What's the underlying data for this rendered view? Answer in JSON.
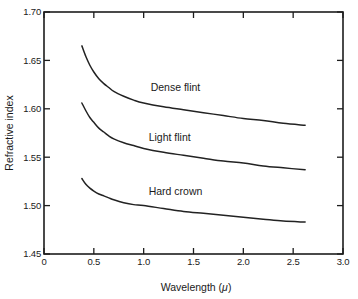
{
  "chart_data": {
    "type": "line",
    "title": "",
    "xlabel": "Wavelength (μ)",
    "ylabel": "Refractive index",
    "xlim": [
      0,
      3.0
    ],
    "ylim": [
      1.45,
      1.7
    ],
    "xticks": [
      "0",
      "0.5",
      "1.0",
      "1.5",
      "2.0",
      "2.5",
      "3.0"
    ],
    "xtick_values": [
      0,
      0.5,
      1.0,
      1.5,
      2.0,
      2.5,
      3.0
    ],
    "yticks": [
      "1.45",
      "1.50",
      "1.55",
      "1.60",
      "1.65",
      "1.70"
    ],
    "ytick_values": [
      1.45,
      1.5,
      1.55,
      1.6,
      1.65,
      1.7
    ],
    "grid": false,
    "legend_position": "inline-annotations",
    "series": [
      {
        "name": "Dense flint",
        "label_x": 1.07,
        "label_y": 1.618,
        "x": [
          0.38,
          0.42,
          0.46,
          0.5,
          0.55,
          0.6,
          0.65,
          0.7,
          0.8,
          0.9,
          1.0,
          1.2,
          1.4,
          1.6,
          1.8,
          2.0,
          2.2,
          2.4,
          2.62
        ],
        "values": [
          1.665,
          1.654,
          1.645,
          1.638,
          1.631,
          1.626,
          1.622,
          1.618,
          1.613,
          1.609,
          1.606,
          1.602,
          1.599,
          1.596,
          1.593,
          1.59,
          1.588,
          1.585,
          1.583
        ]
      },
      {
        "name": "Light flint",
        "label_x": 1.05,
        "label_y": 1.567,
        "x": [
          0.38,
          0.42,
          0.46,
          0.5,
          0.55,
          0.6,
          0.65,
          0.7,
          0.8,
          0.9,
          1.0,
          1.2,
          1.4,
          1.6,
          1.8,
          2.0,
          2.2,
          2.4,
          2.62
        ],
        "values": [
          1.606,
          1.598,
          1.591,
          1.586,
          1.58,
          1.576,
          1.572,
          1.569,
          1.565,
          1.562,
          1.559,
          1.555,
          1.552,
          1.549,
          1.546,
          1.544,
          1.541,
          1.539,
          1.537
        ]
      },
      {
        "name": "Hard crown",
        "label_x": 1.05,
        "label_y": 1.511,
        "x": [
          0.38,
          0.42,
          0.46,
          0.5,
          0.55,
          0.6,
          0.65,
          0.7,
          0.8,
          0.9,
          1.0,
          1.2,
          1.4,
          1.6,
          1.8,
          2.0,
          2.2,
          2.4,
          2.62
        ],
        "values": [
          1.528,
          1.522,
          1.518,
          1.515,
          1.512,
          1.51,
          1.508,
          1.506,
          1.503,
          1.501,
          1.5,
          1.497,
          1.494,
          1.492,
          1.49,
          1.488,
          1.486,
          1.484,
          1.483
        ]
      }
    ]
  },
  "figure": {
    "axis_color": "#1d1d1d",
    "curve_color": "#222222",
    "background": "#ffffff"
  }
}
